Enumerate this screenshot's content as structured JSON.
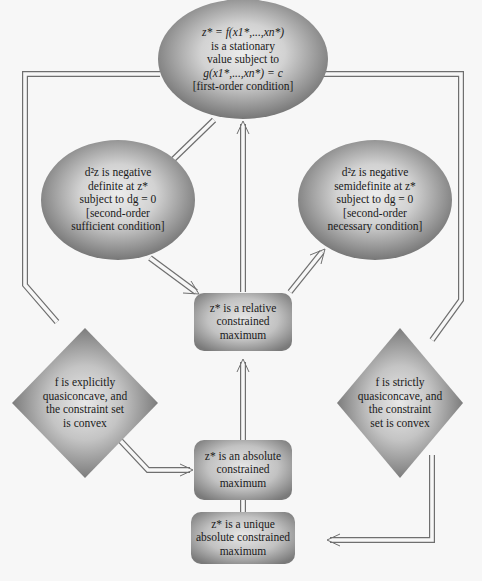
{
  "colors": {
    "background": "#f7f7f7",
    "shape_light": "#e4e4e4",
    "shape_dark": "#7a7a7a",
    "connector": "#6f6f6f",
    "text": "#1a1a1a"
  },
  "nodes": {
    "stationary": {
      "shape": "ellipse",
      "lines": [
        "z* = f(x1*,...,xn*)",
        "is a stationary",
        "value subject to",
        "g(x1*,...,xn*) = c",
        "[first-order condition]"
      ]
    },
    "sufficient": {
      "shape": "ellipse",
      "lines": [
        "d²z is negative",
        "definite at z*",
        "subject to dg = 0",
        "[second-order",
        "sufficient condition]"
      ]
    },
    "necessary": {
      "shape": "ellipse",
      "lines": [
        "d²z is negative",
        "semidefinite at z*",
        "subject to dg = 0",
        "[second-order",
        "necessary condition]"
      ]
    },
    "relative": {
      "shape": "rounded-rect",
      "lines": [
        "z* is a relative",
        "constrained",
        "maximum"
      ]
    },
    "explicit": {
      "shape": "diamond",
      "lines": [
        "f is explicitly",
        "quasiconcave, and",
        "the constraint set",
        "is convex"
      ]
    },
    "strict": {
      "shape": "diamond",
      "lines": [
        "f is strictly",
        "quasiconcave, and",
        "the constraint",
        "set is convex"
      ]
    },
    "absolute": {
      "shape": "rounded-rect",
      "lines": [
        "z* is an absolute",
        "constrained",
        "maximum"
      ]
    },
    "unique": {
      "shape": "rounded-rect",
      "lines": [
        "z* is a unique",
        "absolute constrained",
        "maximum"
      ]
    }
  },
  "edges": [
    {
      "from": "sufficient",
      "to": "stationary",
      "style": "double-line"
    },
    {
      "from": "sufficient",
      "to": "relative",
      "style": "double-arrow"
    },
    {
      "from": "relative",
      "to": "stationary",
      "style": "double-arrow"
    },
    {
      "from": "relative",
      "to": "necessary",
      "style": "double-arrow"
    },
    {
      "from": "absolute",
      "to": "relative",
      "style": "double-arrow"
    },
    {
      "from": "unique",
      "to": "absolute",
      "style": "double-arrow"
    },
    {
      "from": "stationary",
      "to": "explicit",
      "style": "double-line"
    },
    {
      "from": "explicit",
      "to": "absolute",
      "style": "double-arrow"
    },
    {
      "from": "stationary",
      "to": "strict",
      "style": "double-line"
    },
    {
      "from": "strict",
      "to": "unique",
      "style": "double-arrow"
    }
  ]
}
